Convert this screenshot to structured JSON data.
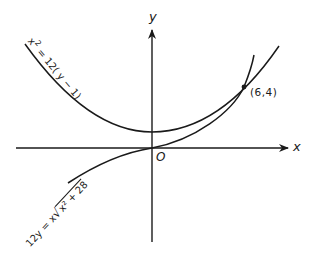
{
  "diagram": {
    "axes": {
      "x_label": "x",
      "y_label": "y",
      "origin_label": "O"
    },
    "curves": [
      {
        "name": "parabola",
        "equation": "x² = 12(y − 1)",
        "label_parts": {
          "lhs": "x",
          "exp": "2",
          "rest": " = 12( y − 1)"
        }
      },
      {
        "name": "curve2",
        "equation": "12y = x√(x² + 28)",
        "label_parts": {
          "lhs": "12y = x",
          "radicand": "x² + 28"
        }
      }
    ],
    "intersection": {
      "label": "(6,4)",
      "x": 6,
      "y": 4
    },
    "colors": {
      "ink": "#1a1a1a",
      "background": "#ffffff"
    }
  }
}
